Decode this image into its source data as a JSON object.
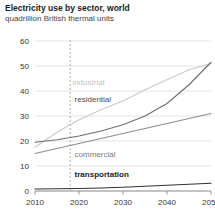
{
  "chart_data": {
    "type": "line",
    "title": "Electricity use by sector, world",
    "subtitle": "quadrillion British thermal units",
    "xlabel": "",
    "ylabel": "",
    "xlim": [
      2010,
      2050
    ],
    "ylim": [
      0,
      60
    ],
    "yticks": [
      0,
      10,
      20,
      30,
      40,
      50,
      60
    ],
    "xticks": [
      2010,
      2020,
      2030,
      2040,
      2050
    ],
    "grid": true,
    "legend_position": "inline-labels",
    "x": [
      2010,
      2015,
      2020,
      2025,
      2030,
      2035,
      2040,
      2045,
      2050
    ],
    "series": [
      {
        "name": "industrial",
        "color": "#c9c9c9",
        "label_color": "#c2c2c2",
        "label_weight": "normal",
        "label_x": 2018.5,
        "label_y": 43.5,
        "values": [
          17.5,
          23.5,
          28.5,
          32.5,
          36.0,
          40.5,
          44.5,
          48.5,
          51.0
        ]
      },
      {
        "name": "residential",
        "color": "#6e6e6e",
        "label_color": "#4a4a4a",
        "label_weight": "normal",
        "label_x": 2019,
        "label_y": 37.0,
        "values": [
          19.5,
          20.5,
          22.0,
          24.0,
          26.5,
          30.0,
          35.0,
          42.5,
          51.5
        ]
      },
      {
        "name": "commercial",
        "color": "#8c8c8c",
        "label_color": "#7a7a7a",
        "label_weight": "normal",
        "label_x": 2019,
        "label_y": 15.0,
        "values": [
          15.0,
          17.0,
          19.0,
          21.0,
          23.0,
          25.0,
          27.0,
          29.0,
          31.0
        ]
      },
      {
        "name": "transportation",
        "color": "#333333",
        "label_color": "#1a1a1a",
        "label_weight": "bold",
        "label_x": 2019,
        "label_y": 7.0,
        "values": [
          0.8,
          0.9,
          1.0,
          1.2,
          1.5,
          1.9,
          2.3,
          2.7,
          3.1
        ]
      }
    ],
    "annotations": [
      {
        "name": "history-projection-divider",
        "type": "vline",
        "x": 2018
      }
    ]
  }
}
